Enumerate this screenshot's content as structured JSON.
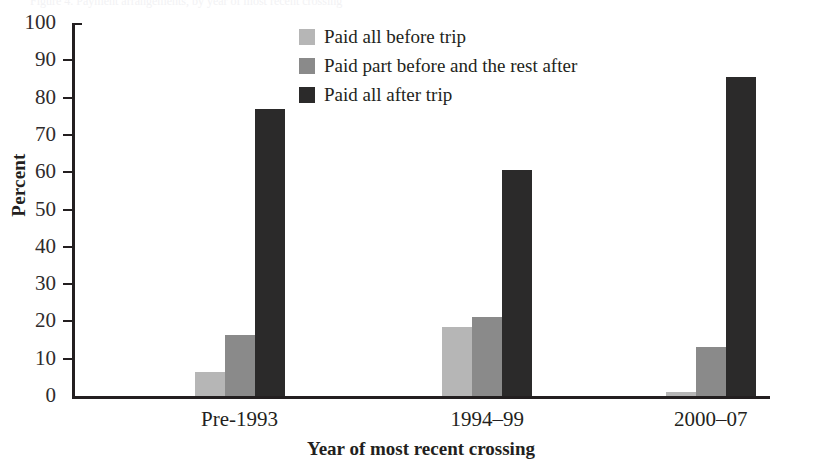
{
  "cropped_header_text": "Figure 4. Payment arrangements, by year of most recent crossing",
  "chart_data": {
    "type": "bar",
    "title": "",
    "xlabel": "Year of most recent crossing",
    "ylabel": "Percent",
    "categories": [
      "Pre-1993",
      "1994–99",
      "2000–07"
    ],
    "ylim": [
      0,
      100
    ],
    "yticks": [
      0,
      10,
      20,
      30,
      40,
      50,
      60,
      70,
      80,
      90,
      100
    ],
    "ytick_labels": [
      "0",
      "10",
      "20",
      "30",
      "40",
      "50",
      "60",
      "70",
      "80",
      "90",
      "100"
    ],
    "grid": false,
    "legend_position": "top-center",
    "series": [
      {
        "name": "Paid all before trip",
        "color": "#b6b6b6",
        "values": [
          6.5,
          18.5,
          1.0
        ]
      },
      {
        "name": "Paid part before and the rest after",
        "color": "#8a8a8a",
        "values": [
          16.4,
          21.3,
          13.2
        ]
      },
      {
        "name": "Paid all after trip",
        "color": "#2b2a2a",
        "values": [
          77.0,
          60.5,
          85.5
        ]
      }
    ]
  },
  "legend": {
    "items": [
      {
        "label": "Paid all before trip",
        "color": "#b6b6b6"
      },
      {
        "label": "Paid part before and the rest after",
        "color": "#8a8a8a"
      },
      {
        "label": "Paid all after trip",
        "color": "#2b2a2a"
      }
    ]
  },
  "colors": {
    "light": "#b6b6b6",
    "medium": "#8a8a8a",
    "dark": "#2b2a2a",
    "axis": "#231f20",
    "background": "#ffffff"
  }
}
